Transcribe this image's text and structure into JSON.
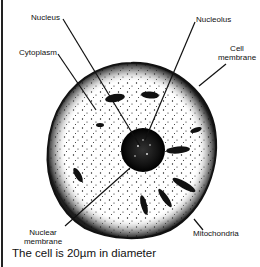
{
  "diagram": {
    "labels": {
      "nucleus": "Nucleus",
      "cytoplasm": "Cytoplasm",
      "nucleolus": "Nucleolus",
      "cell_membrane_line1": "Cell",
      "cell_membrane_line2": "membrane",
      "nuclear_membrane_line1": "Nuclear",
      "nuclear_membrane_line2": "membrane",
      "mitochondria": "Mitochondria"
    },
    "caption": "The cell is 20µm in diameter",
    "colors": {
      "ink": "#111111",
      "background": "#ffffff"
    }
  }
}
